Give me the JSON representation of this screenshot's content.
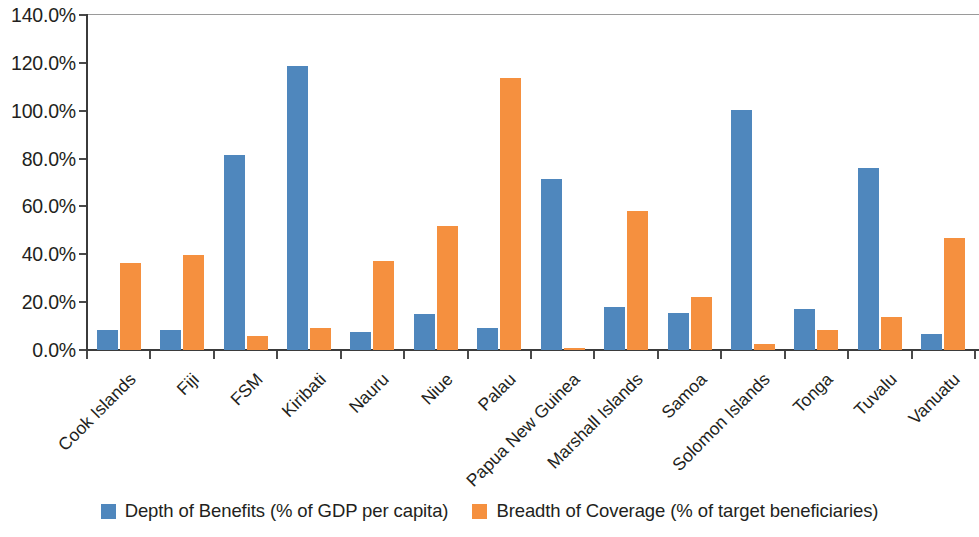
{
  "chart_data": {
    "type": "bar",
    "title": "",
    "subtitle": "",
    "xlabel": "",
    "ylabel": "",
    "grid": false,
    "legend_position": "bottom",
    "ylim": [
      0,
      140
    ],
    "y_ticks": [
      0,
      20,
      40,
      60,
      80,
      100,
      120,
      140
    ],
    "y_tick_labels": [
      "0.0%",
      "20.0%",
      "40.0%",
      "60.0%",
      "80.0%",
      "100.0%",
      "120.0%",
      "140.0%"
    ],
    "categories": [
      "Cook Islands",
      "Fiji",
      "FSM",
      "Kiribati",
      "Nauru",
      "Niue",
      "Palau",
      "Papua New Guinea",
      "Marshall Islands",
      "Samoa",
      "Solomon Islands",
      "Tonga",
      "Tuvalu",
      "Vanuatu"
    ],
    "series": [
      {
        "name": "Depth of Benefits (% of GDP per capita)",
        "color": "#4f87bd",
        "values": [
          8.5,
          8.2,
          81.5,
          118.5,
          7.5,
          15.0,
          9.0,
          71.5,
          17.8,
          15.5,
          100.5,
          17.0,
          76.0,
          6.8
        ]
      },
      {
        "name": "Breadth of Coverage (% of target beneficiaries)",
        "color": "#f5903f",
        "values": [
          36.5,
          39.5,
          5.8,
          9.2,
          37.0,
          51.8,
          113.5,
          1.0,
          58.2,
          22.0,
          2.5,
          8.3,
          13.8,
          47.0
        ]
      }
    ]
  },
  "legend": {
    "items": [
      {
        "label": "Depth of Benefits (% of GDP per capita)",
        "swatch": "depth"
      },
      {
        "label": "Breadth of Coverage (% of target beneficiaries)",
        "swatch": "breadth"
      }
    ]
  },
  "colors": {
    "depth": "#4f87bd",
    "breadth": "#f5903f",
    "axis": "#3b3b3b",
    "text": "#231f20",
    "background": "#ffffff"
  }
}
